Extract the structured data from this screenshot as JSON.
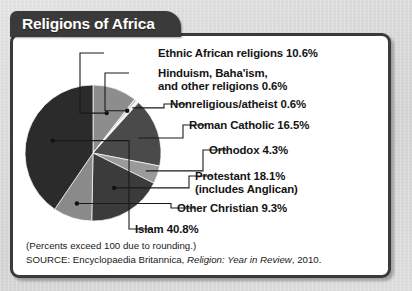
{
  "title": "Religions of Africa",
  "chart_data": {
    "type": "pie",
    "title": "Religions of Africa",
    "unit": "percent",
    "total_note": "Percents exceed 100 due to rounding.",
    "legend_position": "callout-labels-right",
    "grid": false,
    "categories": [
      "Ethnic African religions",
      "Hinduism, Baha'ism, and other religions",
      "Nonreligious/atheist",
      "Roman Catholic",
      "Orthodox",
      "Protestant (includes Anglican)",
      "Other Christian",
      "Islam"
    ],
    "values": [
      10.6,
      0.6,
      0.6,
      16.5,
      4.3,
      18.1,
      9.3,
      40.8
    ],
    "colors": [
      "#8d8d8d",
      "#c9c9c9",
      "#f2f2f2",
      "#4a4a4a",
      "#9a9a9a",
      "#3b3b3b",
      "#8a8a8a",
      "#2b2b2b"
    ],
    "slices": [
      {
        "label": "Ethnic African religions",
        "value": 10.6,
        "value_label": "10.6%",
        "color": "#8d8d8d"
      },
      {
        "label": "Hinduism, Baha'ism, and other religions",
        "value": 0.6,
        "value_label": "0.6%",
        "color": "#c9c9c9"
      },
      {
        "label": "Nonreligious/atheist",
        "value": 0.6,
        "value_label": "0.6%",
        "color": "#f2f2f2"
      },
      {
        "label": "Roman Catholic",
        "value": 16.5,
        "value_label": "16.5%",
        "color": "#4a4a4a"
      },
      {
        "label": "Orthodox",
        "value": 4.3,
        "value_label": "4.3%",
        "color": "#9a9a9a"
      },
      {
        "label": "Protestant (includes Anglican)",
        "value": 18.1,
        "value_label": "18.1%",
        "color": "#3b3b3b"
      },
      {
        "label": "Other Christian",
        "value": 9.3,
        "value_label": "9.3%",
        "color": "#8a8a8a"
      },
      {
        "label": "Islam",
        "value": 40.8,
        "value_label": "40.8%",
        "color": "#2b2b2b"
      }
    ]
  },
  "callouts": {
    "ethnic_african": "Ethnic African religions  10.6%",
    "hinduism_line1": "Hinduism, Baha'ism,",
    "hinduism_line2": "and other religions  0.6%",
    "nonreligious": "Nonreligious/atheist  0.6%",
    "roman_catholic": "Roman Catholic  16.5%",
    "orthodox": "Orthodox  4.3%",
    "protestant_line1": "Protestant  18.1%",
    "protestant_line2": "(includes Anglican)",
    "other_christian": "Other Christian  9.3%",
    "islam": "Islam  40.8%"
  },
  "footnotes": {
    "rounding_note": "(Percents exceed 100 due to rounding.)",
    "source_prefix": "SOURCE: Encyclopaedia Britannica, ",
    "source_italic": "Religion: Year in Review",
    "source_suffix": ", 2010."
  }
}
